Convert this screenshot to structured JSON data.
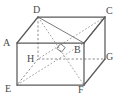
{
  "figure": {
    "kind": "geometry-diagram",
    "shape_name": "cuboid",
    "stroke_color": "#5a5a5a",
    "hidden_stroke_color": "#8a8a8a",
    "diagonal_stroke_color": "#7a7a7a",
    "label_color": "#4a4a4a",
    "background_color": "#ffffff",
    "vertices": [
      {
        "name": "A",
        "label": "A",
        "x": 17,
        "y": 43,
        "hidden": false,
        "label_x": 3,
        "label_y": 38
      },
      {
        "name": "B",
        "label": "B",
        "x": 84,
        "y": 43,
        "hidden": false,
        "label_x": 74,
        "label_y": 45
      },
      {
        "name": "C",
        "label": "C",
        "x": 105,
        "y": 17,
        "hidden": false,
        "label_x": 106,
        "label_y": 6
      },
      {
        "name": "D",
        "label": "D",
        "x": 38,
        "y": 17,
        "hidden": false,
        "label_x": 33,
        "label_y": 5
      },
      {
        "name": "E",
        "label": "E",
        "x": 17,
        "y": 85,
        "hidden": false,
        "label_x": 5,
        "label_y": 84
      },
      {
        "name": "F",
        "label": "F",
        "x": 84,
        "y": 85,
        "hidden": false,
        "label_x": 78,
        "label_y": 85
      },
      {
        "name": "G",
        "label": "G",
        "x": 105,
        "y": 59,
        "hidden": false,
        "label_x": 106,
        "label_y": 52
      },
      {
        "name": "H",
        "label": "H",
        "x": 38,
        "y": 59,
        "hidden": true,
        "label_x": 27,
        "label_y": 54
      }
    ],
    "solid_edges": [
      {
        "from": "A",
        "to": "B"
      },
      {
        "from": "A",
        "to": "D"
      },
      {
        "from": "A",
        "to": "E"
      },
      {
        "from": "B",
        "to": "C"
      },
      {
        "from": "B",
        "to": "F"
      },
      {
        "from": "C",
        "to": "D"
      },
      {
        "from": "C",
        "to": "G"
      },
      {
        "from": "E",
        "to": "F"
      },
      {
        "from": "F",
        "to": "G"
      }
    ],
    "dashed_edges": [
      {
        "from": "D",
        "to": "H"
      },
      {
        "from": "H",
        "to": "G"
      },
      {
        "from": "H",
        "to": "E"
      }
    ],
    "solid_diagonals": [
      {
        "from": "D",
        "to": "B"
      },
      {
        "from": "C",
        "to": "B"
      }
    ],
    "dashed_diagonals": [
      {
        "from": "D",
        "to": "F"
      },
      {
        "from": "C",
        "to": "H"
      },
      {
        "from": "E",
        "to": "B"
      }
    ],
    "right_angle_mark": {
      "present": true,
      "x": 61,
      "y": 48,
      "size": 6,
      "rotation_deg": 38
    }
  }
}
